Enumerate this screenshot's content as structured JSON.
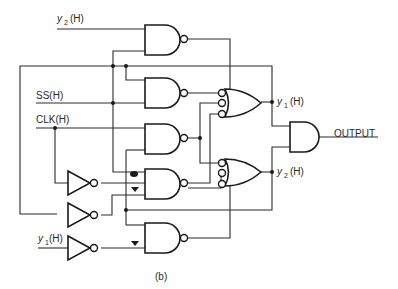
{
  "figure": {
    "caption": "(b)",
    "colors": {
      "ink": "#1a1a1a",
      "background": "#ffffff"
    }
  },
  "labels": {
    "y2_input": {
      "var": "y",
      "sub": "2",
      "suffix": "(H)"
    },
    "ss_input": "SS(H)",
    "clk_input": "CLK(H)",
    "y1_input": {
      "var": "y",
      "sub": "1",
      "suffix": "(H)"
    },
    "y1_output": {
      "var": "y",
      "sub": "1",
      "suffix": "(H)"
    },
    "y2_output": {
      "var": "y",
      "sub": "2",
      "suffix": "(H)"
    },
    "output": "OUTPUT"
  },
  "gates": {
    "nand": [
      "N1",
      "N2",
      "N3",
      "N4",
      "N5"
    ],
    "inverters": [
      "INV1",
      "INV2",
      "INV3"
    ],
    "or_with_inverted_inputs": [
      "OR1",
      "OR2"
    ],
    "and": [
      "AND1"
    ]
  },
  "markers": {
    "triangles": 2,
    "note": "triangle / blot markers near NAND inputs"
  }
}
